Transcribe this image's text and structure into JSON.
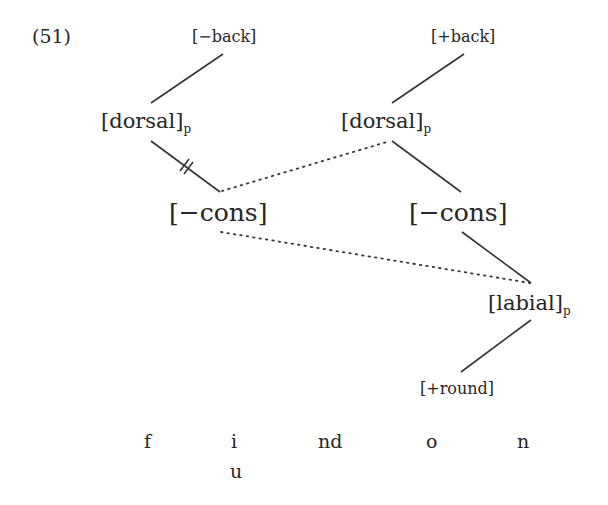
{
  "example_number": "(51)",
  "tiers": {
    "minus_back": "[−back]",
    "plus_back": "[+back]",
    "dorsal_left": {
      "label": "[dorsal]",
      "subscript": "p"
    },
    "dorsal_right": {
      "label": "[dorsal]",
      "subscript": "p"
    },
    "cons_left": "[−cons]",
    "cons_right": "[−cons]",
    "labial": {
      "label": "[labial]",
      "subscript": "p"
    },
    "plus_round": "[+round]"
  },
  "segments": [
    "f",
    "i",
    "nd",
    "o",
    "n"
  ],
  "segment_below_i": "u",
  "links": [
    {
      "from": "[−back]",
      "to": "[dorsal]p (left)",
      "style": "solid"
    },
    {
      "from": "[dorsal]p (left)",
      "to": "[−cons] (left)",
      "style": "solid-delinked"
    },
    {
      "from": "[+back]",
      "to": "[dorsal]p (right)",
      "style": "solid"
    },
    {
      "from": "[dorsal]p (right)",
      "to": "[−cons] (left)",
      "style": "dotted"
    },
    {
      "from": "[dorsal]p (right)",
      "to": "[−cons] (right)",
      "style": "solid"
    },
    {
      "from": "[−cons] (left)",
      "to": "[labial]p",
      "style": "dotted"
    },
    {
      "from": "[−cons] (right)",
      "to": "[labial]p",
      "style": "solid"
    },
    {
      "from": "[labial]p",
      "to": "[+round]",
      "style": "solid"
    }
  ]
}
